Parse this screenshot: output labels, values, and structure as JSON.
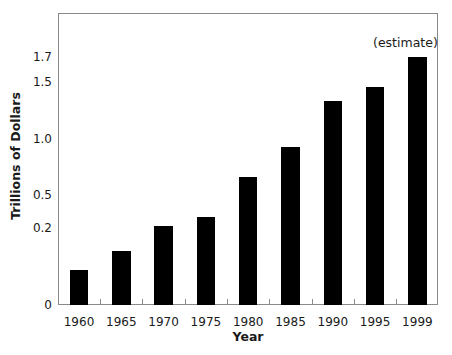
{
  "chart_data": {
    "type": "bar",
    "title": "",
    "xlabel": "Year",
    "ylabel": "Trillions of Dollars",
    "categories": [
      "1960",
      "1965",
      "1970",
      "1975",
      "1980",
      "1985",
      "1990",
      "1995",
      "1999"
    ],
    "values": [
      0.09,
      0.14,
      0.22,
      0.3,
      0.66,
      0.93,
      1.33,
      1.46,
      1.7
    ],
    "yticks": [
      {
        "label": "0",
        "value": 0
      },
      {
        "label": "0.2",
        "value": 0.2
      },
      {
        "label": "0.5",
        "value": 0.5
      },
      {
        "label": "1.0",
        "value": 1.0
      },
      {
        "label": "1.5",
        "value": 1.5
      },
      {
        "label": "1.7",
        "value": 1.7
      }
    ],
    "y_scale_note": "non-linear axis",
    "ylim": [
      0,
      1.9
    ],
    "grid": false,
    "legend": null,
    "annotations": [
      {
        "text": "(estimate)",
        "category": "1999"
      }
    ],
    "bar_color": "#000000",
    "frame_color": "#8a8a8a"
  }
}
